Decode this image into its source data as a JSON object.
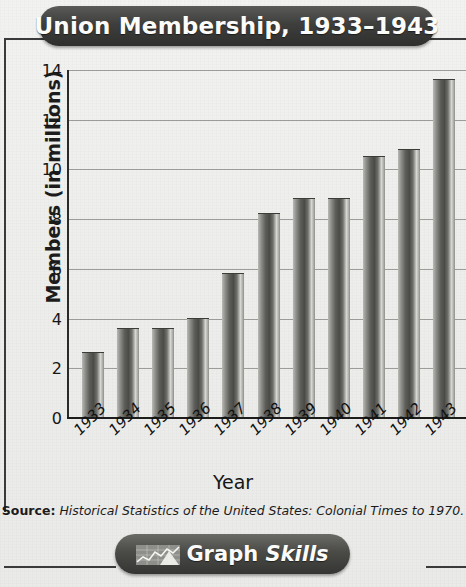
{
  "title": "Union Membership, 1933–1943",
  "source_prefix": "Source:",
  "source_citation": "Historical Statistics of the United States: Colonial Times to 1970.",
  "footer": {
    "label_main": "Graph",
    "label_italic": "Skills",
    "icon": "line-chart-icon"
  },
  "colors": {
    "banner_dark": "#3e3e3c",
    "banner_text": "#fbfbf9",
    "bar_dark": "#4a4a46",
    "bar_light": "#d6d6d2",
    "gridline": "#8d8d89",
    "page_bg": "#efefed"
  },
  "chart_data": {
    "type": "bar",
    "title": "Union Membership, 1933–1943",
    "xlabel": "Year",
    "ylabel": "Members (in millions)",
    "categories": [
      "1933",
      "1934",
      "1935",
      "1936",
      "1937",
      "1938",
      "1939",
      "1940",
      "1941",
      "1942",
      "1943"
    ],
    "values": [
      2.6,
      3.6,
      3.6,
      4.0,
      5.8,
      8.2,
      8.8,
      8.8,
      10.5,
      10.8,
      13.6
    ],
    "ylim": [
      0,
      14
    ],
    "ytick_values": [
      0,
      2,
      4,
      6,
      8,
      10,
      12,
      14
    ],
    "ytick_labels": [
      "0",
      "2",
      "4",
      "6",
      "8",
      "10",
      "12",
      "14"
    ],
    "grid": true,
    "legend": false,
    "series": [
      {
        "name": "Members (in millions)",
        "values": [
          2.6,
          3.6,
          3.6,
          4.0,
          5.8,
          8.2,
          8.8,
          8.8,
          10.5,
          10.8,
          13.6
        ]
      }
    ],
    "source": "Historical Statistics of the United States: Colonial Times to 1970."
  }
}
